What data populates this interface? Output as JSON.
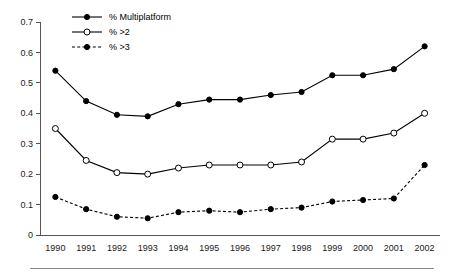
{
  "chart_data": {
    "type": "line",
    "title": "",
    "xlabel": "",
    "ylabel": "",
    "categories": [
      "1990",
      "1991",
      "1992",
      "1993",
      "1994",
      "1995",
      "1996",
      "1997",
      "1998",
      "1999",
      "2000",
      "2001",
      "2002"
    ],
    "ylim": [
      0,
      0.7
    ],
    "yticks": [
      "0",
      "0.1",
      "0.2",
      "0.3",
      "0.4",
      "0.5",
      "0.6",
      "0.7"
    ],
    "ytick_values": [
      0,
      0.1,
      0.2,
      0.3,
      0.4,
      0.5,
      0.6,
      0.7
    ],
    "grid": false,
    "legend_position": "top-left-inside",
    "series": [
      {
        "name": "% Multiplatform",
        "marker": "filled-circle",
        "linestyle": "solid",
        "color": "#000000",
        "values": [
          0.54,
          0.44,
          0.395,
          0.39,
          0.43,
          0.445,
          0.445,
          0.46,
          0.47,
          0.525,
          0.525,
          0.545,
          0.62
        ]
      },
      {
        "name": "% >2",
        "marker": "open-circle",
        "linestyle": "solid",
        "color": "#000000",
        "values": [
          0.35,
          0.245,
          0.205,
          0.2,
          0.22,
          0.23,
          0.23,
          0.23,
          0.24,
          0.315,
          0.315,
          0.335,
          0.4
        ]
      },
      {
        "name": "% >3",
        "marker": "filled-circle",
        "linestyle": "dashed",
        "color": "#000000",
        "values": [
          0.125,
          0.085,
          0.06,
          0.055,
          0.075,
          0.08,
          0.075,
          0.085,
          0.09,
          0.11,
          0.115,
          0.12,
          0.23
        ]
      }
    ]
  },
  "legend": {
    "items": [
      {
        "label": "% Multiplatform"
      },
      {
        "label": "% >2"
      },
      {
        "label": "% >3"
      }
    ]
  },
  "axes": {
    "y_tick_labels": [
      "0.7",
      "0.6",
      "0.5",
      "0.4",
      "0.3",
      "0.2",
      "0.1",
      "0"
    ],
    "x_tick_labels": [
      "1990",
      "1991",
      "1992",
      "1993",
      "1994",
      "1995",
      "1996",
      "1997",
      "1998",
      "1999",
      "2000",
      "2001",
      "2002"
    ]
  }
}
